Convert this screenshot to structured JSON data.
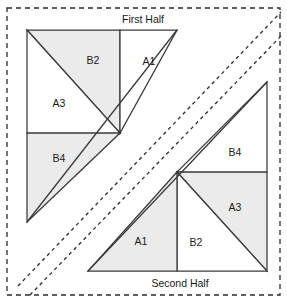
{
  "diagram": {
    "colors": {
      "fill_shaded": "#ebebeb",
      "fill_plain": "#ffffff",
      "stroke": "#3a3a3a",
      "dashed_stroke": "#2b2b2b",
      "background": "#ffffff",
      "text": "#1a1a1a"
    },
    "halves": [
      {
        "key": "first",
        "label": "First Half",
        "label_x": 143,
        "label_y": 20
      },
      {
        "key": "second",
        "label": "Second Half",
        "label_x": 180,
        "label_y": 284
      }
    ],
    "piece_labels": [
      {
        "key": "first_b2",
        "text": "B2",
        "x": 93,
        "y": 61
      },
      {
        "key": "first_a1",
        "text": "A1",
        "x": 149,
        "y": 62
      },
      {
        "key": "first_a3",
        "text": "A3",
        "x": 59,
        "y": 104
      },
      {
        "key": "first_b4",
        "text": "B4",
        "x": 59,
        "y": 159
      },
      {
        "key": "second_b4",
        "text": "B4",
        "x": 235,
        "y": 153
      },
      {
        "key": "second_a3",
        "text": "A3",
        "x": 235,
        "y": 208
      },
      {
        "key": "second_b2",
        "text": "B2",
        "x": 196,
        "y": 243
      },
      {
        "key": "second_a1",
        "text": "A1",
        "x": 141,
        "y": 242
      }
    ],
    "pieces": [
      {
        "key": "first_b2",
        "name": "first-half-piece-b2",
        "shaded": true,
        "points": "27,30 120,30 120,133 27,30"
      },
      {
        "key": "first_a1",
        "name": "first-half-piece-a1",
        "shaded": false,
        "points": "120,30 177,30 120,133 120,30"
      },
      {
        "key": "first_a3",
        "name": "first-half-piece-a3",
        "shaded": false,
        "points": "27,30 120,133 27,133 27,30"
      },
      {
        "key": "first_b4",
        "name": "first-half-piece-b4",
        "shaded": true,
        "points": "27,133 120,133 27,222 27,133"
      },
      {
        "key": "second_b4",
        "name": "second-half-piece-b4",
        "shaded": false,
        "points": "267,82 267,172 177,172 267,82"
      },
      {
        "key": "second_a3",
        "name": "second-half-piece-a3",
        "shaded": true,
        "points": "177,172 267,172 267,271 177,172"
      },
      {
        "key": "second_b2",
        "name": "second-half-piece-b2",
        "shaded": false,
        "points": "177,172 267,271 177,271 177,172"
      },
      {
        "key": "second_a1",
        "name": "second-half-piece-a1",
        "shaded": true,
        "points": "177,172 177,271 88,271 177,172"
      }
    ],
    "long_edges": [
      {
        "key": "first_long_diagonal",
        "name": "first-half-long-diagonal-edge",
        "d": "M 177,30 L 27,222"
      },
      {
        "key": "second_long_diagonal",
        "name": "second-half-long-diagonal-edge",
        "d": "M 267,82 L 88,271"
      }
    ],
    "guides": {
      "outer_cut_line": {
        "name": "outer-cutting-guide",
        "x": 7,
        "y": 8,
        "width": 273,
        "height": 287
      },
      "diagonal_seam_guides": [
        {
          "key": "seam_guide_upper",
          "name": "diagonal-seam-guide-upper",
          "d": "M 18,286 L 281,12"
        },
        {
          "key": "seam_guide_lower",
          "name": "diagonal-seam-guide-lower",
          "d": "M 30,295 L 281,36"
        }
      ]
    }
  }
}
